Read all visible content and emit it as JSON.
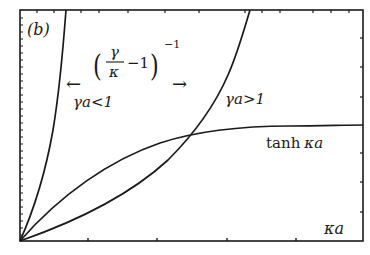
{
  "figure": {
    "panel_label": "(b)",
    "x_axis_label": "κa",
    "curves": [
      {
        "name": "steep-curve",
        "regime_label": "γa<1"
      },
      {
        "name": "gamma-a-greater-than-one-curve",
        "label": "γa>1"
      },
      {
        "name": "tanh-curve",
        "label": "tanh κa"
      }
    ],
    "expression": {
      "numerator": "γ",
      "denominator": "κ",
      "minus_one": "−1",
      "exponent": "−1"
    },
    "left_arrow": "←",
    "right_arrow": "→",
    "left_regime_label": "γa<1",
    "right_regime_label": "γa>1",
    "tanh_label_text": "tanh",
    "tanh_label_arg": "κa"
  },
  "colors": {
    "line": "#1a1a1a",
    "background": "#ffffff"
  }
}
